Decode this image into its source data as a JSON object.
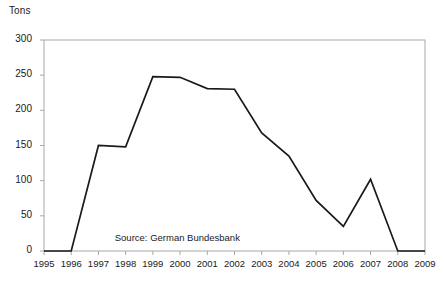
{
  "chart_data": {
    "type": "line",
    "title": "",
    "subtitle": "",
    "xlabel": "",
    "ylabel": "Tons",
    "ylim": [
      0,
      300
    ],
    "yticks": [
      0,
      50,
      100,
      150,
      200,
      250,
      300
    ],
    "ytick_labels": [
      "0",
      "50",
      "100",
      "150",
      "200",
      "250",
      "300"
    ],
    "xlim": [
      1995,
      2009
    ],
    "categories": [
      1995,
      1996,
      1997,
      1998,
      1999,
      2000,
      2001,
      2002,
      2003,
      2004,
      2005,
      2006,
      2007,
      2008,
      2009
    ],
    "xtick_labels": [
      "1995",
      "1996",
      "1997",
      "1998",
      "1999",
      "2000",
      "2001",
      "2002",
      "2003",
      "2004",
      "2005",
      "2006",
      "2007",
      "2008",
      "2009"
    ],
    "values": [
      0,
      0,
      150,
      148,
      248,
      247,
      231,
      230,
      168,
      135,
      72,
      35,
      102,
      0,
      0
    ],
    "grid": false,
    "legend": null,
    "legend_position": "none",
    "series": [
      {
        "name": "Tons",
        "color": "#1a1a1a",
        "values": [
          0,
          0,
          150,
          148,
          248,
          247,
          231,
          230,
          168,
          135,
          72,
          35,
          102,
          0,
          0
        ]
      }
    ],
    "annotations": [
      {
        "text": "Source: German Bundesbank",
        "x": 1997.6,
        "y": 18
      }
    ]
  },
  "axis": {
    "y_title": "Tons",
    "source_note": "Source: German Bundesbank"
  },
  "colors": {
    "line": "#1a1a1a",
    "frame": "#a8a8a8",
    "text": "#1a1a1a",
    "background": "#ffffff"
  }
}
